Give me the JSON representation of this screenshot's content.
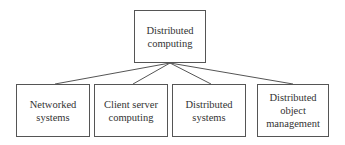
{
  "diagram": {
    "root": {
      "label": "Distributed\ncomputing"
    },
    "children": [
      {
        "label": "Networked\nsystems"
      },
      {
        "label": "Client server\ncomputing"
      },
      {
        "label": "Distributed\nsystems"
      },
      {
        "label": "Distributed\nobject\nmanagement"
      }
    ],
    "colors": {
      "line": "#555555",
      "border": "#555555",
      "text": "#333333"
    }
  }
}
